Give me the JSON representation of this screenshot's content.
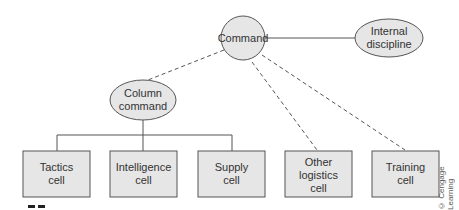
{
  "diagram": {
    "nodes": [
      {
        "id": "command",
        "shape": "circle",
        "lines": [
          "Command"
        ]
      },
      {
        "id": "internal_discipline",
        "shape": "ellipse",
        "lines": [
          "Internal",
          "discipline"
        ]
      },
      {
        "id": "column_command",
        "shape": "ellipse",
        "lines": [
          "Column",
          "command"
        ]
      },
      {
        "id": "tactics_cell",
        "shape": "box",
        "lines": [
          "Tactics",
          "cell"
        ]
      },
      {
        "id": "intelligence_cell",
        "shape": "box",
        "lines": [
          "Intelligence",
          "cell"
        ]
      },
      {
        "id": "supply_cell",
        "shape": "box",
        "lines": [
          "Supply",
          "cell"
        ]
      },
      {
        "id": "other_logistics_cell",
        "shape": "box",
        "lines": [
          "Other",
          "logistics",
          "cell"
        ]
      },
      {
        "id": "training_cell",
        "shape": "box",
        "lines": [
          "Training",
          "cell"
        ]
      }
    ],
    "edges": [
      {
        "from": "command",
        "to": "internal_discipline",
        "style": "solid"
      },
      {
        "from": "command",
        "to": "column_command",
        "style": "dashed"
      },
      {
        "from": "command",
        "to": "other_logistics_cell",
        "style": "dashed"
      },
      {
        "from": "command",
        "to": "training_cell",
        "style": "dashed"
      },
      {
        "from": "column_command",
        "to": "tactics_cell",
        "style": "solid"
      },
      {
        "from": "column_command",
        "to": "intelligence_cell",
        "style": "solid"
      },
      {
        "from": "column_command",
        "to": "supply_cell",
        "style": "solid"
      }
    ],
    "colors": {
      "fill": "#e6e6e6",
      "stroke": "#555555"
    }
  },
  "labels": {
    "command": [
      "Command"
    ],
    "internal_discipline": [
      "Internal",
      "discipline"
    ],
    "column_command": [
      "Column",
      "command"
    ],
    "tactics_cell": [
      "Tactics",
      "cell"
    ],
    "intelligence_cell": [
      "Intelligence",
      "cell"
    ],
    "supply_cell": [
      "Supply",
      "cell"
    ],
    "other_logistics_cell": [
      "Other",
      "logistics",
      "cell"
    ],
    "training_cell": [
      "Training",
      "cell"
    ]
  },
  "copyright": "© Cengage Learning"
}
